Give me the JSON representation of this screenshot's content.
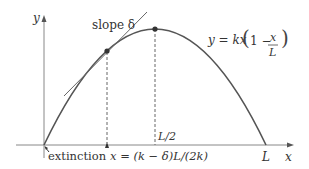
{
  "diagram": {
    "axes": {
      "x_label": "x",
      "y_label": "y"
    },
    "labels": {
      "slope": "slope δ",
      "equation_lhs": "y = kx",
      "equation_open": "(",
      "equation_one_minus": "1 −",
      "equation_num": "x",
      "equation_den": "L",
      "equation_close": ")",
      "half_L": "L/2",
      "L": "L",
      "extinction": "extinction",
      "x_marker": "x = (k − δ)L/(2k)"
    },
    "colors": {
      "curve": "#555555",
      "axis": "#777777",
      "text": "#333333",
      "point": "#333333"
    }
  }
}
